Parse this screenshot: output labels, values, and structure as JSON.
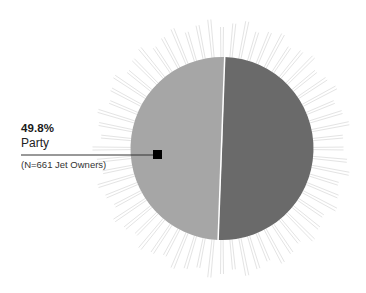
{
  "chart_data": {
    "type": "pie",
    "title": "",
    "categories": [
      "Party",
      "Other"
    ],
    "values": [
      49.8,
      50.2
    ],
    "colors": [
      "#a6a6a6",
      "#6a6a6a"
    ],
    "annotation": {
      "value_label": "49.8%",
      "category_label": "Party",
      "sample_note": "(N=661 Jet Owners)",
      "marker_color": "#000000"
    },
    "decoration": "sunburst-rays",
    "legend": "none"
  },
  "colors": {
    "background": "#ffffff",
    "ray": "#e4e4e4",
    "divider": "#ffffff",
    "leader_line": "#333333"
  }
}
